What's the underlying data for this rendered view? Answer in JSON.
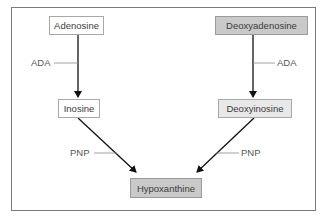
{
  "diagram": {
    "type": "metabolic-pathway",
    "nodes": [
      {
        "id": "adenosine",
        "label": "Adenosine",
        "fill": "#ffffff"
      },
      {
        "id": "deoxyadenosine",
        "label": "Deoxyadenosine",
        "fill": "#c9c9c9"
      },
      {
        "id": "inosine",
        "label": "Inosine",
        "fill": "#ffffff"
      },
      {
        "id": "deoxyinosine",
        "label": "Deoxyinosine",
        "fill": "#e8e8e8"
      },
      {
        "id": "hypoxanthine",
        "label": "Hypoxanthine",
        "fill": "#c9c9c9"
      }
    ],
    "edges": [
      {
        "from": "adenosine",
        "to": "inosine",
        "enzyme": "ADA"
      },
      {
        "from": "deoxyadenosine",
        "to": "deoxyinosine",
        "enzyme": "ADA"
      },
      {
        "from": "inosine",
        "to": "hypoxanthine",
        "enzyme": "PNP"
      },
      {
        "from": "deoxyinosine",
        "to": "hypoxanthine",
        "enzyme": "PNP"
      }
    ],
    "labels": {
      "ada_left": "ADA",
      "ada_right": "ADA",
      "pnp_left": "PNP",
      "pnp_right": "PNP"
    }
  }
}
